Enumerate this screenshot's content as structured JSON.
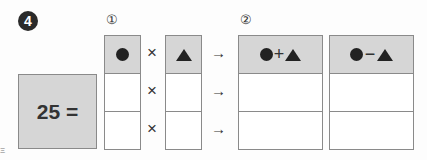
{
  "problem": {
    "number": "4",
    "step1_label": "①",
    "step2_label": "②",
    "equation_left": "25 =",
    "times_symbol": "×",
    "arrow_symbol": "→",
    "plus_symbol": "+",
    "minus_symbol": "−",
    "header_col1_icon": "circle-icon",
    "header_col2_icon": "triangle-icon",
    "header_sum": "●+▲",
    "header_diff": "●−▲",
    "rows": [
      {
        "circle": "",
        "triangle": "",
        "sum": "",
        "diff": ""
      },
      {
        "circle": "",
        "triangle": "",
        "sum": "",
        "diff": ""
      }
    ],
    "edge_fragment": "Ξ"
  },
  "colors": {
    "header_fill": "#d6d6d6",
    "border": "#8a8a8a",
    "badge": "#2a2a2a"
  }
}
